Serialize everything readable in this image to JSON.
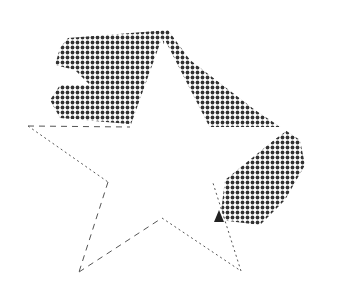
{
  "canvas": {
    "width": 364,
    "height": 283,
    "background": "#ffffff"
  },
  "halftone": {
    "color": "#333333",
    "dot_spacing": 5,
    "dot_radius": 1.9,
    "polygon": [
      [
        68,
        38
      ],
      [
        168,
        30
      ],
      [
        190,
        60
      ],
      [
        255,
        110
      ],
      [
        300,
        140
      ],
      [
        305,
        165
      ],
      [
        285,
        200
      ],
      [
        260,
        225
      ],
      [
        220,
        220
      ],
      [
        225,
        180
      ],
      [
        290,
        127
      ],
      [
        210,
        128
      ],
      [
        165,
        40
      ],
      [
        140,
        125
      ],
      [
        60,
        118
      ],
      [
        50,
        100
      ],
      [
        60,
        85
      ],
      [
        90,
        85
      ],
      [
        75,
        70
      ],
      [
        55,
        65
      ],
      [
        60,
        48
      ]
    ]
  },
  "star": {
    "fill": "#ffffff",
    "stroke": "#555555",
    "points": [
      [
        162,
        38
      ],
      [
        188,
        127
      ],
      [
        292,
        127
      ],
      [
        213,
        183
      ],
      [
        241,
        271
      ],
      [
        162,
        218
      ],
      [
        79,
        272
      ],
      [
        108,
        182
      ],
      [
        28,
        126
      ],
      [
        130,
        127
      ]
    ],
    "edges": [
      {
        "from": 8,
        "to": 9,
        "style": "dashed"
      },
      {
        "from": 8,
        "to": 7,
        "style": "dotted"
      },
      {
        "from": 7,
        "to": 6,
        "style": "dashed"
      },
      {
        "from": 6,
        "to": 5,
        "style": "dashed"
      },
      {
        "from": 5,
        "to": 4,
        "style": "dotted"
      },
      {
        "from": 4,
        "to": 3,
        "style": "dotted"
      }
    ]
  },
  "marker": {
    "color": "#222222",
    "points": [
      [
        214,
        222
      ],
      [
        219,
        210
      ],
      [
        224,
        222
      ]
    ]
  },
  "label": "Star shape over halftone brush stroke"
}
